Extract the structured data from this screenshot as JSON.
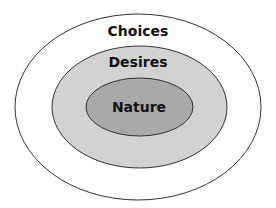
{
  "diagram": {
    "type": "nested-ellipses",
    "layers": [
      {
        "label": "Choices",
        "fill": "#ffffff"
      },
      {
        "label": "Desires",
        "fill": "#d2d2d2"
      },
      {
        "label": "Nature",
        "fill": "#a9a9a9"
      }
    ],
    "stroke": "#333333"
  }
}
